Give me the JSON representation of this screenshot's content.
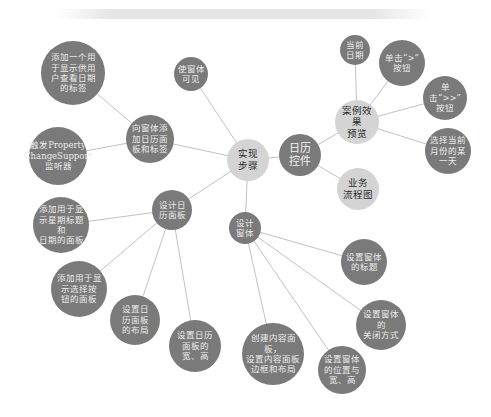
{
  "diagram": {
    "type": "mind-map",
    "colors": {
      "dark_node": "#7a7a7a",
      "light_node": "#d4d4d4",
      "edge": "#c2c2c2",
      "dark_text": "#ececec",
      "light_text": "#2a2a2a"
    },
    "nodes": [
      {
        "id": "impl",
        "label": "实现\n步骤",
        "style": "light",
        "x": 248,
        "y": 160,
        "r": 21
      },
      {
        "id": "calendar",
        "label": "日历\n控件",
        "style": "dark-big",
        "x": 300,
        "y": 155,
        "r": 21
      },
      {
        "id": "preview",
        "label": "案例效果\n预览",
        "style": "light",
        "x": 357,
        "y": 122,
        "r": 22
      },
      {
        "id": "flow",
        "label": "业务\n流程图",
        "style": "light",
        "x": 358,
        "y": 189,
        "r": 21
      },
      {
        "id": "cur_date",
        "label": "当前\n日期",
        "style": "dark",
        "x": 355,
        "y": 50,
        "r": 15
      },
      {
        "id": "btn_gt",
        "label": "单击“>”\n按钮",
        "style": "dark",
        "x": 402,
        "y": 63,
        "r": 23
      },
      {
        "id": "btn_gtgt",
        "label": "单击“>>”\n按钮",
        "style": "dark",
        "x": 445,
        "y": 98,
        "r": 22
      },
      {
        "id": "pick_day",
        "label": "选择当前\n月份的某\n一天",
        "style": "dark",
        "x": 448,
        "y": 151,
        "r": 23
      },
      {
        "id": "visible",
        "label": "使窗体\n可见",
        "style": "dark",
        "x": 191,
        "y": 74,
        "r": 17
      },
      {
        "id": "add_panel_label",
        "label": "向窗体添\n加日历面\n板和标签",
        "style": "dark",
        "x": 150,
        "y": 139,
        "r": 24
      },
      {
        "id": "add_date_label",
        "label": "添加一个用\n于显示供用\n户查看日期\n的标签",
        "style": "dark",
        "x": 73,
        "y": 73,
        "r": 32
      },
      {
        "id": "pcs_listener",
        "label": "触发Property\nChangeSupport\n监听器",
        "style": "dark",
        "x": 58,
        "y": 156,
        "r": 29
      },
      {
        "id": "design_cal_panel",
        "label": "设计日\n历面板",
        "style": "dark",
        "x": 172,
        "y": 210,
        "r": 20
      },
      {
        "id": "week_date_panel",
        "label": "添加用于显\n示星期标题和\n日期的面板",
        "style": "dark",
        "x": 61,
        "y": 225,
        "r": 28
      },
      {
        "id": "select_btn_panel",
        "label": "添加用于显\n示选择按\n钮的面板",
        "style": "dark",
        "x": 79,
        "y": 289,
        "r": 28
      },
      {
        "id": "cal_layout",
        "label": "设置日\n历面板\n的布局",
        "style": "dark",
        "x": 135,
        "y": 320,
        "r": 25
      },
      {
        "id": "cal_size",
        "label": "设置日历\n面板的\n宽、高",
        "style": "dark",
        "x": 195,
        "y": 346,
        "r": 26
      },
      {
        "id": "design_window",
        "label": "设计\n窗体",
        "style": "dark",
        "x": 245,
        "y": 228,
        "r": 16
      },
      {
        "id": "win_title",
        "label": "设置窗体\n的标题",
        "style": "dark",
        "x": 364,
        "y": 262,
        "r": 23
      },
      {
        "id": "win_close",
        "label": "设置窗体的\n关闭方式",
        "style": "dark",
        "x": 381,
        "y": 325,
        "r": 25
      },
      {
        "id": "content_pane",
        "label": "创建内容面板，\n设置内容面板\n边框和布局",
        "style": "dark",
        "x": 273,
        "y": 354,
        "r": 31
      },
      {
        "id": "win_pos_size",
        "label": "设置窗体\n的位置与\n宽、高",
        "style": "dark",
        "x": 342,
        "y": 370,
        "r": 24
      }
    ],
    "edges": [
      [
        "impl",
        "calendar"
      ],
      [
        "calendar",
        "preview"
      ],
      [
        "calendar",
        "flow"
      ],
      [
        "preview",
        "cur_date"
      ],
      [
        "preview",
        "btn_gt"
      ],
      [
        "preview",
        "btn_gtgt"
      ],
      [
        "preview",
        "pick_day"
      ],
      [
        "impl",
        "visible"
      ],
      [
        "impl",
        "add_panel_label"
      ],
      [
        "add_panel_label",
        "add_date_label"
      ],
      [
        "add_panel_label",
        "pcs_listener"
      ],
      [
        "impl",
        "design_cal_panel"
      ],
      [
        "design_cal_panel",
        "week_date_panel"
      ],
      [
        "design_cal_panel",
        "select_btn_panel"
      ],
      [
        "design_cal_panel",
        "cal_layout"
      ],
      [
        "design_cal_panel",
        "cal_size"
      ],
      [
        "impl",
        "design_window"
      ],
      [
        "design_window",
        "win_title"
      ],
      [
        "design_window",
        "win_close"
      ],
      [
        "design_window",
        "content_pane"
      ],
      [
        "design_window",
        "win_pos_size"
      ]
    ]
  }
}
